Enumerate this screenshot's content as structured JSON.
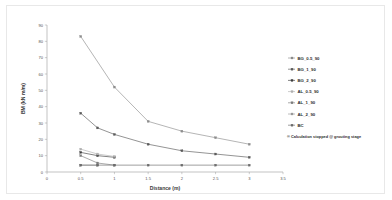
{
  "chart_data": {
    "type": "line",
    "title": "",
    "xlabel": "Distance (m)",
    "ylabel": "BM (kN m/m)",
    "xlim": [
      0,
      3.5
    ],
    "ylim": [
      0,
      90
    ],
    "xticks": [
      "0",
      "0.5",
      "1",
      "1.5",
      "2",
      "2.5",
      "3",
      "3.5"
    ],
    "xtick_values": [
      0,
      0.5,
      1,
      1.5,
      2,
      2.5,
      3,
      3.5
    ],
    "yticks": [
      "0",
      "10",
      "20",
      "30",
      "40",
      "50",
      "60",
      "70",
      "80",
      "90"
    ],
    "ytick_values": [
      0,
      10,
      20,
      30,
      40,
      50,
      60,
      70,
      80,
      90
    ],
    "grid": false,
    "legend_position": "right",
    "series": [
      {
        "name": "BG_0.5_90",
        "color": "#8c8c8c",
        "marker": "square",
        "x": [
          0.5,
          1,
          1.5,
          2,
          2.5,
          3
        ],
        "values": [
          83,
          52,
          31,
          25,
          21,
          17
        ]
      },
      {
        "name": "BG_1_90",
        "color": "#5a5a5a",
        "marker": "square",
        "x": [
          0.5,
          0.75,
          1,
          1.5,
          2,
          2.5,
          3
        ],
        "values": [
          36,
          27,
          23,
          17,
          13,
          11,
          9
        ]
      },
      {
        "name": "BG_2_90",
        "color": "#3f3f3f",
        "marker": "square",
        "x": [
          0.5,
          0.75,
          1
        ],
        "values": [
          12,
          10,
          9
        ]
      },
      {
        "name": "AL_0.5_90",
        "color": "#b0b0b0",
        "marker": "square",
        "x": [
          0.5,
          0.75,
          1
        ],
        "values": [
          14,
          11,
          9.5
        ]
      },
      {
        "name": "AL_1_90",
        "color": "#7d7d7d",
        "marker": "square",
        "x": [
          0.5,
          0.75,
          1
        ],
        "values": [
          10,
          5.5,
          4.2
        ]
      },
      {
        "name": "AL_2_90",
        "color": "#999999",
        "marker": "square",
        "x": [
          0.5,
          0.75
        ],
        "values": [
          4.2,
          4.2
        ]
      },
      {
        "name": "BC",
        "color": "#6b6b6b",
        "marker": "square",
        "x": [
          0.5,
          0.75,
          1,
          1.5,
          2,
          2.5,
          3
        ],
        "values": [
          4.2,
          4.2,
          4.2,
          4.2,
          4.2,
          4.2,
          4.2
        ]
      }
    ],
    "annotations": [
      "® Calculation stopped @ grouting stage"
    ]
  },
  "legend": {
    "items": [
      {
        "label": "BG_0.5_90"
      },
      {
        "label": "BG_1_90"
      },
      {
        "label": "BG_2_90"
      },
      {
        "label": "AL_0.5_90"
      },
      {
        "label": "AL_1_90"
      },
      {
        "label": "AL_2_90"
      },
      {
        "label": "BC"
      }
    ],
    "note": "® Calculation stopped @ grouting stage"
  },
  "axes": {
    "x_title": "Distance (m)",
    "y_title": "BM (kN m/m)",
    "x_tick_labels": [
      "0",
      "0.5",
      "1",
      "1.5",
      "2",
      "2.5",
      "3",
      "3.5"
    ],
    "y_tick_labels": [
      "0",
      "10",
      "20",
      "30",
      "40",
      "50",
      "60",
      "70",
      "80",
      "90"
    ]
  }
}
